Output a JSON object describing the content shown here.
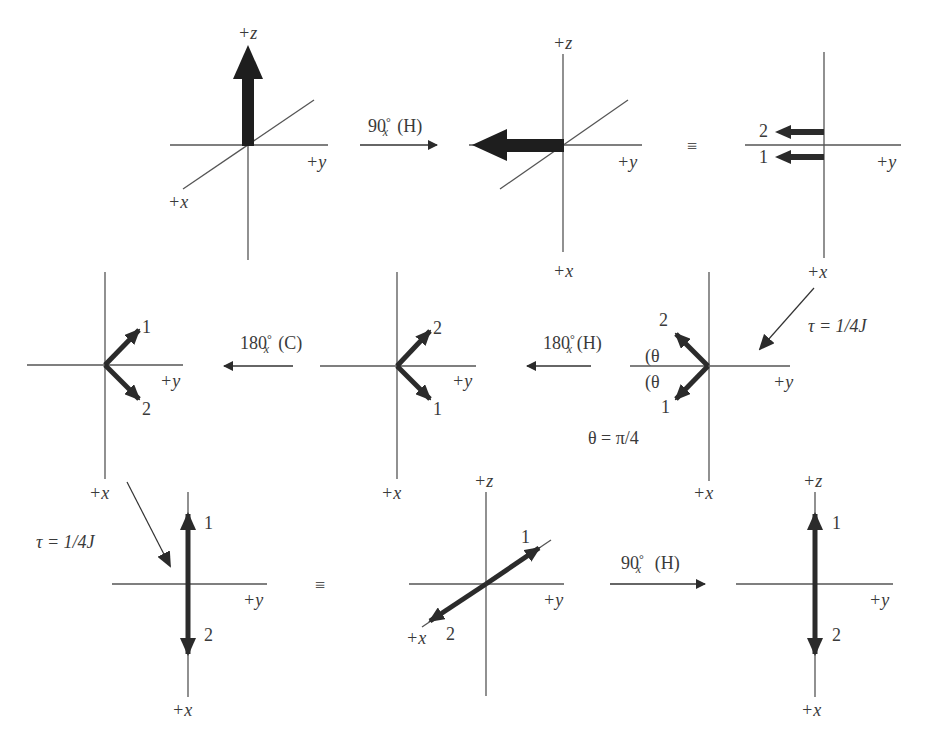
{
  "figure": {
    "colors": {
      "axis": "#555555",
      "vector": "#2b2b2b",
      "text": "#3a3a3a"
    }
  },
  "axes_labels": {
    "x": "+x",
    "y": "+y",
    "z": "+z"
  },
  "panels": [
    {
      "id": "p1",
      "row": 1,
      "col": 1,
      "type": "3d",
      "vectors": [
        {
          "direction": "+z",
          "label": ""
        }
      ]
    },
    {
      "id": "p2",
      "row": 1,
      "col": 2,
      "type": "3d",
      "vectors": [
        {
          "direction": "-y",
          "label": ""
        }
      ]
    },
    {
      "id": "p3",
      "row": 1,
      "col": 3,
      "type": "2d",
      "vectors": [
        {
          "direction": "-y",
          "label": "2"
        },
        {
          "direction": "-y",
          "label": "1"
        }
      ]
    },
    {
      "id": "p4",
      "row": 2,
      "col": 3,
      "type": "2d",
      "vectors": [
        {
          "direction": "-y,-x",
          "label": "2"
        },
        {
          "direction": "-y,+x",
          "label": "1"
        }
      ],
      "angle_marks": [
        "(θ",
        "(θ"
      ],
      "note": "θ = π/4"
    },
    {
      "id": "p5",
      "row": 2,
      "col": 2,
      "type": "2d",
      "vectors": [
        {
          "direction": "+y,-x",
          "label": "2"
        },
        {
          "direction": "+y,+x",
          "label": "1"
        }
      ]
    },
    {
      "id": "p6",
      "row": 2,
      "col": 1,
      "type": "2d",
      "vectors": [
        {
          "direction": "+y,-x",
          "label": "1"
        },
        {
          "direction": "+y,+x",
          "label": "2"
        }
      ]
    },
    {
      "id": "p7",
      "row": 3,
      "col": 1,
      "type": "2d",
      "vectors": [
        {
          "direction": "-x",
          "label": "1"
        },
        {
          "direction": "+x",
          "label": "2"
        }
      ]
    },
    {
      "id": "p8",
      "row": 3,
      "col": 2,
      "type": "3d",
      "vectors": [
        {
          "direction": "-x",
          "label": "1"
        },
        {
          "direction": "+x",
          "label": "2"
        }
      ]
    },
    {
      "id": "p9",
      "row": 3,
      "col": 3,
      "type": "2d",
      "vectors": [
        {
          "direction": "+z",
          "label": "1"
        },
        {
          "direction": "-z",
          "label": "2"
        }
      ]
    }
  ],
  "operations": {
    "op1": {
      "angle": "90",
      "axis": "x",
      "pulse": "(H)"
    },
    "op2": {
      "angle": "180",
      "axis": "x",
      "pulse": "(H)"
    },
    "op3": {
      "angle": "180",
      "axis": "x",
      "pulse": "(C)"
    },
    "op4": {
      "angle": "90",
      "axis": "x",
      "pulse": "(H)"
    },
    "delay1": "τ = 1/4J",
    "delay2": "τ = 1/4J"
  },
  "symbols": {
    "equiv": "≡",
    "degree": "°",
    "theta": "(θ",
    "theta_note": "θ = π/4"
  },
  "vector_labels": {
    "one": "1",
    "two": "2"
  }
}
